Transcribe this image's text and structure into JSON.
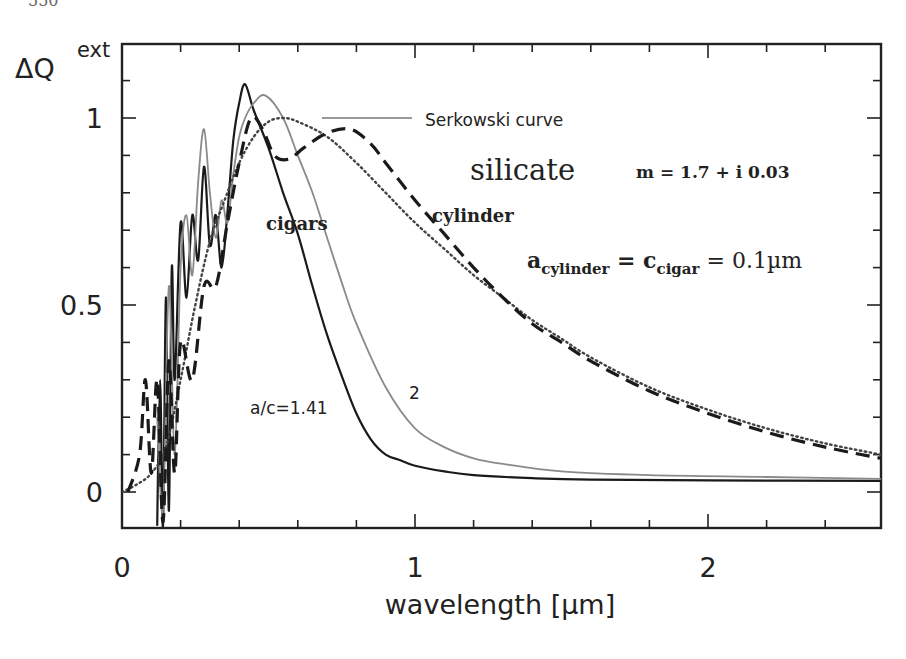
{
  "page_header": {
    "page_number_fragment": "550"
  },
  "chart_data": {
    "type": "line",
    "title": "",
    "xlabel": "wavelength [µm]",
    "ylabel": "ΔQ",
    "ylabel_superscript": "ext",
    "xlim": [
      0,
      2.59
    ],
    "ylim": [
      -0.09,
      1.2
    ],
    "grid": false,
    "x_ticks": {
      "major": [
        0,
        1,
        2
      ],
      "labels": [
        "0",
        "1",
        "2"
      ],
      "minor_step": 0.2
    },
    "y_ticks": {
      "major": [
        0,
        0.5,
        1
      ],
      "labels": [
        "0",
        "0.5",
        "1"
      ],
      "minor_step": 0.1
    },
    "series": [
      {
        "name": "cigar a/c=1.41",
        "style": "solid-dark",
        "color": "#1a1a1a",
        "x": [
          0.12,
          0.13,
          0.14,
          0.15,
          0.16,
          0.17,
          0.18,
          0.2,
          0.22,
          0.24,
          0.26,
          0.28,
          0.3,
          0.32,
          0.34,
          0.36,
          0.38,
          0.4,
          0.42,
          0.45,
          0.5,
          0.55,
          0.6,
          0.65,
          0.7,
          0.75,
          0.8,
          0.85,
          0.9,
          0.95,
          1.0,
          1.1,
          1.2,
          1.4,
          1.6,
          2.0,
          2.59
        ],
        "y": [
          -0.09,
          0.3,
          -0.09,
          0.52,
          -0.05,
          0.6,
          0.3,
          0.72,
          0.52,
          0.74,
          0.62,
          0.87,
          0.66,
          0.74,
          0.6,
          0.75,
          0.94,
          1.04,
          1.09,
          1.02,
          0.92,
          0.8,
          0.69,
          0.55,
          0.42,
          0.31,
          0.21,
          0.14,
          0.1,
          0.085,
          0.07,
          0.055,
          0.045,
          0.037,
          0.033,
          0.031,
          0.03
        ]
      },
      {
        "name": "cigar a/c=2",
        "style": "solid-grey",
        "color": "#8a8a8a",
        "x": [
          0.12,
          0.14,
          0.16,
          0.18,
          0.2,
          0.22,
          0.24,
          0.26,
          0.28,
          0.3,
          0.32,
          0.34,
          0.36,
          0.38,
          0.4,
          0.42,
          0.45,
          0.49,
          0.55,
          0.6,
          0.65,
          0.7,
          0.75,
          0.8,
          0.9,
          1.0,
          1.1,
          1.2,
          1.3,
          1.5,
          1.8,
          2.2,
          2.59
        ],
        "y": [
          0.2,
          -0.05,
          0.55,
          0.1,
          0.6,
          0.74,
          0.58,
          0.83,
          0.97,
          0.8,
          0.68,
          0.78,
          0.72,
          0.85,
          0.95,
          1.0,
          1.04,
          1.06,
          1.0,
          0.9,
          0.8,
          0.68,
          0.56,
          0.45,
          0.28,
          0.17,
          0.12,
          0.09,
          0.075,
          0.055,
          0.045,
          0.04,
          0.035
        ]
      },
      {
        "name": "Serkowski curve",
        "style": "dotted",
        "color": "#444444",
        "x": [
          0.0,
          0.05,
          0.1,
          0.15,
          0.2,
          0.25,
          0.3,
          0.35,
          0.4,
          0.45,
          0.5,
          0.55,
          0.6,
          0.7,
          0.8,
          0.9,
          1.0,
          1.1,
          1.2,
          1.3,
          1.4,
          1.5,
          1.6,
          1.8,
          2.0,
          2.2,
          2.4,
          2.59
        ],
        "y": [
          0.0,
          0.02,
          0.05,
          0.12,
          0.3,
          0.5,
          0.67,
          0.78,
          0.88,
          0.95,
          0.99,
          1.0,
          0.99,
          0.95,
          0.88,
          0.8,
          0.72,
          0.65,
          0.58,
          0.52,
          0.46,
          0.41,
          0.36,
          0.28,
          0.22,
          0.17,
          0.13,
          0.1
        ]
      },
      {
        "name": "cylinder",
        "style": "dashed",
        "color": "#1a1a1a",
        "x": [
          0.02,
          0.06,
          0.08,
          0.1,
          0.12,
          0.14,
          0.16,
          0.18,
          0.2,
          0.24,
          0.28,
          0.32,
          0.36,
          0.4,
          0.44,
          0.48,
          0.52,
          0.57,
          0.62,
          0.7,
          0.78,
          0.85,
          0.9,
          1.0,
          1.1,
          1.2,
          1.3,
          1.4,
          1.5,
          1.6,
          1.8,
          2.0,
          2.2,
          2.4,
          2.59
        ],
        "y": [
          0.0,
          0.1,
          0.3,
          0.05,
          0.3,
          -0.08,
          0.35,
          0.05,
          0.4,
          0.3,
          0.55,
          0.55,
          0.72,
          0.88,
          1.0,
          0.97,
          0.9,
          0.89,
          0.92,
          0.96,
          0.97,
          0.93,
          0.88,
          0.78,
          0.69,
          0.6,
          0.52,
          0.45,
          0.4,
          0.35,
          0.27,
          0.21,
          0.16,
          0.12,
          0.09
        ]
      }
    ],
    "annotations": [
      {
        "id": "serkowski",
        "text": "Serkowski curve",
        "x": 0.98,
        "y": 1.0,
        "pointer_from": [
          0.68,
          1.0
        ],
        "pointer_to": [
          0.98,
          1.0
        ]
      },
      {
        "id": "silicate",
        "text": "silicate",
        "x": 1.2,
        "y": 0.88
      },
      {
        "id": "refractive_index",
        "text": "m = 1.7 + i 0.03",
        "x": 1.87,
        "y": 0.88
      },
      {
        "id": "cigars",
        "text": "cigars",
        "x": 0.5,
        "y": 0.74
      },
      {
        "id": "cylinder",
        "text": "cylinder",
        "x": 1.06,
        "y": 0.75
      },
      {
        "id": "size_relation",
        "text_parts": [
          "a",
          "cylinder",
          " = c",
          "cigar",
          " = 0.1µm"
        ],
        "x": 1.39,
        "y": 0.6
      },
      {
        "id": "ratio_141",
        "text": "a/c=1.41",
        "x": 0.45,
        "y": 0.22
      },
      {
        "id": "ratio_2",
        "text": "2",
        "x": 0.98,
        "y": 0.26
      }
    ]
  }
}
